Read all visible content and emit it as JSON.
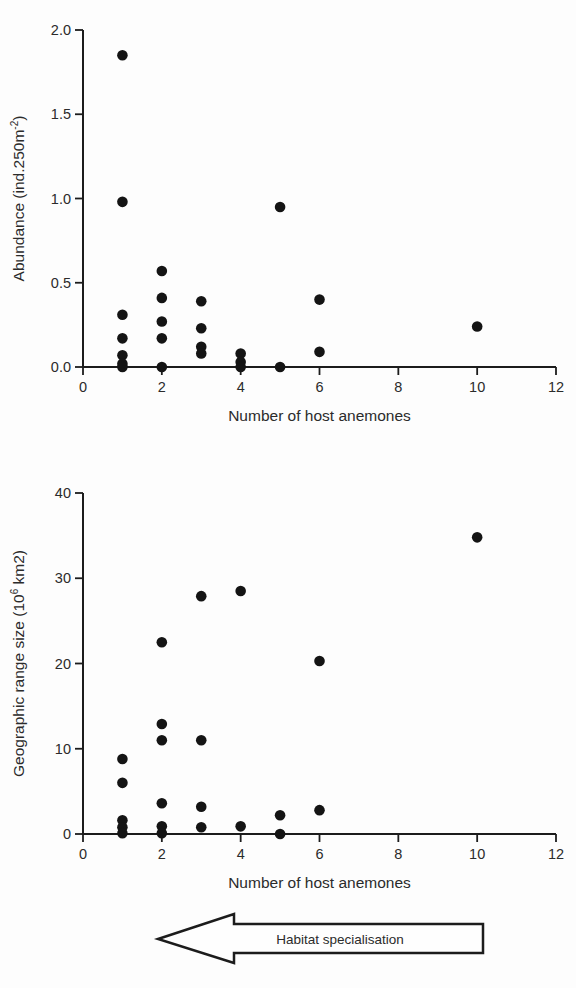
{
  "figure": {
    "background": "#fdfdfd"
  },
  "colors": {
    "point": "#141414",
    "axis": "#1c1c1c",
    "text": "#2b2b2b",
    "arrow_fill": "#fefefe",
    "arrow_outline": "#1c1c1c"
  },
  "chart_data": [
    {
      "id": "abundance-vs-hosts",
      "type": "scatter",
      "title": "",
      "xlabel": "Number of host anemones",
      "ylabel_parts": [
        {
          "t": "Abundance (ind.250m"
        },
        {
          "t": "-2",
          "sup": true
        },
        {
          "t": ")"
        }
      ],
      "xlim": [
        0,
        12
      ],
      "ylim": [
        0,
        2
      ],
      "xtick_values": [
        0,
        2,
        4,
        6,
        8,
        10,
        12
      ],
      "xtick_labels": [
        "0",
        "2",
        "4",
        "6",
        "8",
        "10",
        "12"
      ],
      "ytick_values": [
        0,
        0.5,
        1,
        1.5,
        2
      ],
      "ytick_labels": [
        "0.0",
        "0.5",
        "1.0",
        "1.5",
        "2.0"
      ],
      "grid": false,
      "legend": "none",
      "points": [
        [
          1,
          1.85
        ],
        [
          1,
          0.98
        ],
        [
          1,
          0.31
        ],
        [
          1,
          0.17
        ],
        [
          1,
          0.07
        ],
        [
          1,
          0.02
        ],
        [
          1,
          0.0
        ],
        [
          2,
          0.57
        ],
        [
          2,
          0.41
        ],
        [
          2,
          0.27
        ],
        [
          2,
          0.17
        ],
        [
          2,
          0.0
        ],
        [
          3,
          0.39
        ],
        [
          3,
          0.23
        ],
        [
          3,
          0.12
        ],
        [
          3,
          0.08
        ],
        [
          4,
          0.08
        ],
        [
          4,
          0.03
        ],
        [
          4,
          0.0
        ],
        [
          5,
          0.95
        ],
        [
          5,
          0.0
        ],
        [
          6,
          0.4
        ],
        [
          6,
          0.09
        ],
        [
          10,
          0.24
        ]
      ]
    },
    {
      "id": "range-size-vs-hosts",
      "type": "scatter",
      "title": "",
      "xlabel": "Number of host anemones",
      "ylabel_parts": [
        {
          "t": "Geographic range size (10"
        },
        {
          "t": "6",
          "sup": true
        },
        {
          "t": " km2)"
        }
      ],
      "xlim": [
        0,
        12
      ],
      "ylim": [
        0,
        40
      ],
      "xtick_values": [
        0,
        2,
        4,
        6,
        8,
        10,
        12
      ],
      "xtick_labels": [
        "0",
        "2",
        "4",
        "6",
        "8",
        "10",
        "12"
      ],
      "ytick_values": [
        0,
        10,
        20,
        30,
        40
      ],
      "ytick_labels": [
        "0",
        "10",
        "20",
        "30",
        "40"
      ],
      "grid": false,
      "legend": "none",
      "points": [
        [
          1,
          8.8
        ],
        [
          1,
          6.0
        ],
        [
          1,
          1.6
        ],
        [
          1,
          0.8
        ],
        [
          1,
          0.1
        ],
        [
          2,
          22.5
        ],
        [
          2,
          12.9
        ],
        [
          2,
          11.0
        ],
        [
          2,
          3.6
        ],
        [
          2,
          0.9
        ],
        [
          2,
          0.1
        ],
        [
          3,
          27.9
        ],
        [
          3,
          11.0
        ],
        [
          3,
          3.2
        ],
        [
          3,
          0.8
        ],
        [
          4,
          28.5
        ],
        [
          4,
          0.9
        ],
        [
          5,
          2.2
        ],
        [
          5,
          0.0
        ],
        [
          6,
          20.3
        ],
        [
          6,
          2.8
        ],
        [
          10,
          34.8
        ]
      ]
    }
  ],
  "annotation_arrow": {
    "label": "Habitat specialisation",
    "direction": "left"
  }
}
